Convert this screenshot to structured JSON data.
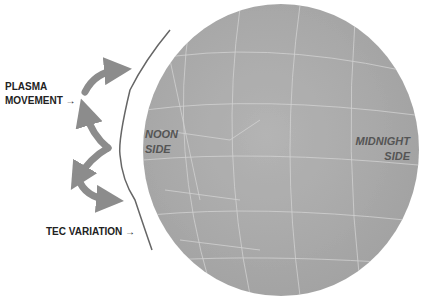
{
  "diagram": {
    "labels": {
      "plasma_line1": "PLASMA",
      "plasma_line2": "MOVEMENT →",
      "tec": "TEC  VARIATION →",
      "noon_line1": "NOON",
      "noon_line2": "SIDE",
      "midnight_line1": "MIDNIGHT",
      "midnight_line2": "SIDE"
    },
    "colors": {
      "globe": "#a9a9a9",
      "grid": "#d8d8d8",
      "arrow": "#8c8c8c",
      "boundary": "#666666",
      "text": "#222222",
      "side_text": "#555555"
    }
  }
}
